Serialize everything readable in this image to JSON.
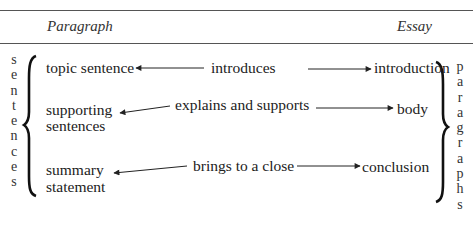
{
  "header": {
    "left": "Paragraph",
    "right": "Essay"
  },
  "left_label": [
    "s",
    "e",
    "n",
    "t",
    "e",
    "n",
    "c",
    "e",
    "s"
  ],
  "right_label": [
    "p",
    "a",
    "r",
    "a",
    "g",
    "r",
    "a",
    "p",
    "h",
    "s"
  ],
  "rows": [
    {
      "paragraph": [
        "topic sentence"
      ],
      "relation": "introduces",
      "essay": "introduction"
    },
    {
      "paragraph": [
        "supporting",
        "sentences"
      ],
      "relation": "explains and supports",
      "essay": "body"
    },
    {
      "paragraph": [
        "summary",
        "statement"
      ],
      "relation": "brings to a close",
      "essay": "conclusion"
    }
  ]
}
